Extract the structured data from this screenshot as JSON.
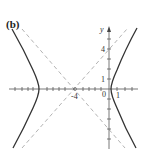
{
  "figure": {
    "panel_label": "(b)",
    "x_axis_label": "",
    "y_axis_label": "y",
    "tick_labels": {
      "x_neg4": "-4",
      "x_0": "0",
      "x_1": "1",
      "y_1": "1",
      "y_4": "4"
    },
    "colors": {
      "curve": "#333333",
      "asymptote": "#aaaaaa",
      "axis": "#555555"
    }
  },
  "diagram": {
    "type": "hyperbola",
    "center": [
      -4,
      0
    ],
    "orientation": "horizontal transverse axis",
    "asymptotes": [
      "y = x + 4",
      "y = -(x + 4)"
    ],
    "vertices_approx": [
      [
        -8.2,
        0
      ],
      [
        0.2,
        0
      ]
    ],
    "x_axis_range": [
      -12,
      3
    ],
    "y_axis_range": [
      -6,
      6
    ]
  }
}
